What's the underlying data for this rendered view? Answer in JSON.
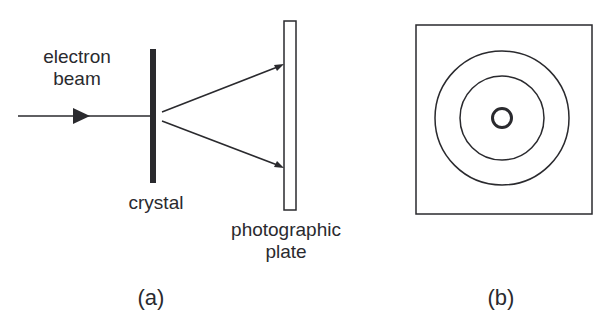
{
  "diagram": {
    "panel_a": {
      "caption": "(a)",
      "labels": {
        "electron_beam_line1": "electron",
        "electron_beam_line2": "beam",
        "crystal": "crystal",
        "plate_line1": "photographic",
        "plate_line2": "plate"
      },
      "components": [
        "electron beam (incident ray with arrow)",
        "crystal (thick dark bar)",
        "two diffracted rays",
        "photographic plate (open rectangle)"
      ]
    },
    "panel_b": {
      "caption": "(b)",
      "description": "diffraction pattern: square frame with central small spot ring and two concentric rings",
      "rings": 3
    },
    "colors": {
      "stroke": "#2a2a2e",
      "background": "#ffffff"
    }
  }
}
